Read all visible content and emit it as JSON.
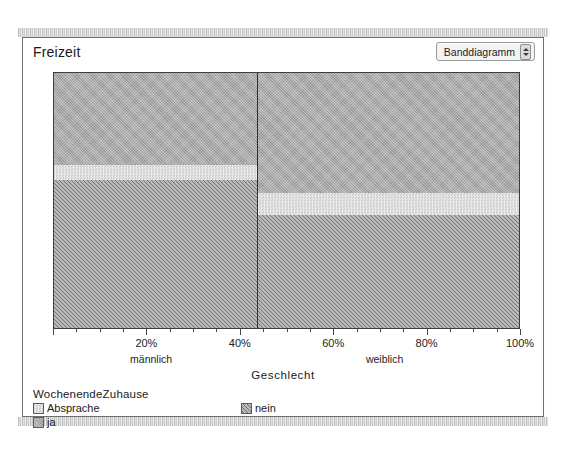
{
  "window": {
    "title": "Freizeit",
    "chart_type_selected": "Banddiagramm"
  },
  "icons": {
    "stepper": "stepper-arrows-icon"
  },
  "chart_data": {
    "type": "bar",
    "orientation": "vertical-stacked-100",
    "title": "Freizeit",
    "xlabel": "Geschlecht",
    "ylabel": "",
    "categories": [
      "männlich",
      "weiblich"
    ],
    "category_widths_pct": [
      43.5,
      56.5
    ],
    "legend_title": "WochenendeZuhause",
    "legend_position": "bottom-left",
    "grid": false,
    "xlim": [
      0,
      100
    ],
    "xticks": [
      20,
      40,
      60,
      80,
      100
    ],
    "xticklabels": [
      "20%",
      "40%",
      "60%",
      "80%",
      "100%"
    ],
    "minor_tick_step": 5,
    "series": [
      {
        "name": "ja",
        "values": [
          35.8,
          46.7
        ],
        "color": "#a9a9a9",
        "pattern": "fine-crosshatch"
      },
      {
        "name": "Absprache",
        "values": [
          5.8,
          8.6
        ],
        "color": "#dedede",
        "pattern": "checker"
      },
      {
        "name": "nein",
        "values": [
          58.4,
          44.7
        ],
        "color": "#9a9a9a",
        "pattern": "diagonal-hatch"
      }
    ],
    "stack_order_top_to_bottom": [
      "ja",
      "Absprache",
      "nein"
    ],
    "annotations": []
  },
  "legend": {
    "title": "WochenendeZuhause",
    "items": [
      {
        "label": "Absprache",
        "swatch": "absprache"
      },
      {
        "label": "nein",
        "swatch": "nein"
      },
      {
        "label": "ja",
        "swatch": "ja"
      }
    ]
  },
  "axis": {
    "title": "Geschlecht",
    "ticks": [
      {
        "label": "20%",
        "pos": 20
      },
      {
        "label": "40%",
        "pos": 40
      },
      {
        "label": "60%",
        "pos": 60
      },
      {
        "label": "80%",
        "pos": 80
      },
      {
        "label": "100%",
        "pos": 100
      }
    ],
    "groups": [
      {
        "label": "männlich",
        "pos": 21
      },
      {
        "label": "weiblich",
        "pos": 71
      }
    ]
  }
}
